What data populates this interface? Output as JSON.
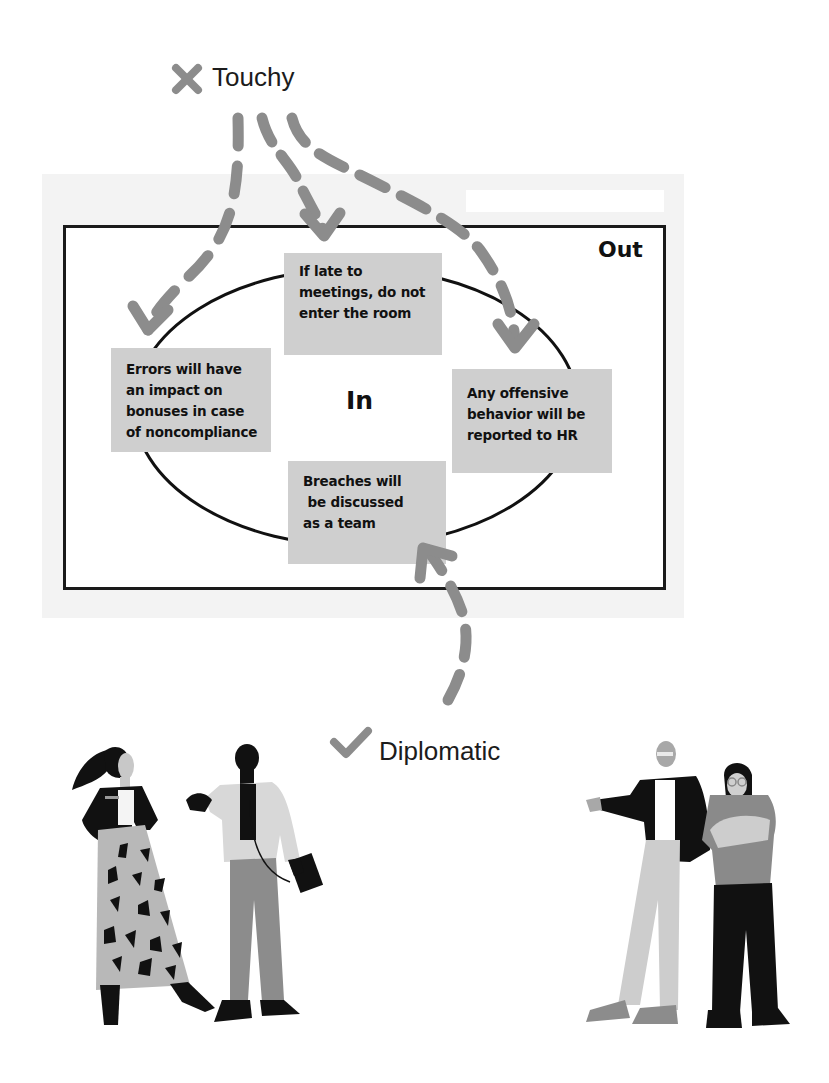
{
  "legend": {
    "negative": {
      "icon": "x-mark-icon",
      "label": "Touchy",
      "color": "#8c8c8c"
    },
    "positive": {
      "icon": "check-mark-icon",
      "label": "Diplomatic",
      "color": "#8c8c8c"
    }
  },
  "diagram": {
    "outer_label": "Out",
    "inner_label": "In",
    "notes": [
      {
        "id": "top",
        "lines": [
          "If late to",
          "meetings, do not",
          "enter the room"
        ]
      },
      {
        "id": "left",
        "lines": [
          "Errors will have",
          "an impact on",
          "bonuses in case",
          "of noncompliance"
        ]
      },
      {
        "id": "right",
        "lines": [
          "Any offensive",
          "behavior will be",
          "reported to HR"
        ]
      },
      {
        "id": "bottom",
        "lines": [
          "Breaches will",
          " be discussed",
          "as a team"
        ]
      }
    ],
    "arrows": {
      "touchy_targets": [
        "left",
        "top",
        "right"
      ],
      "diplomatic_targets": [
        "bottom"
      ]
    }
  },
  "colors": {
    "note_fill": "#cfcfcf",
    "arrow": "#8c8c8c",
    "frame": "#1a1a1a",
    "panel": "#f3f3f3"
  },
  "illustrations": {
    "left_group": [
      "woman-ponytail-patterned-skirt",
      "man-with-phone-and-folder"
    ],
    "right_group": [
      "bald-man-pointing",
      "woman-glasses-arms-crossed"
    ]
  }
}
